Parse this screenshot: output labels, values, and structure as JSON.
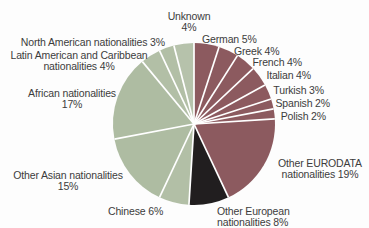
{
  "figure": {
    "background_color": "#fdfdfd",
    "text_color": "#3c3c3c"
  },
  "chart_data": {
    "type": "pie",
    "title": "",
    "start_angle_deg": 0,
    "clockwise": true,
    "legend": "none",
    "center": {
      "x": 194,
      "y": 124
    },
    "radius": 81,
    "separator_color": "#ffffff",
    "separator_width": 1.7,
    "colors": {
      "eurodata_red": "#8c5a5f",
      "european_black": "#211e1f",
      "world_green": "#b2bfa6"
    },
    "slices": [
      {
        "label": "German",
        "value": 5,
        "color": "#8c5a5f"
      },
      {
        "label": "Greek",
        "value": 4,
        "color": "#8c5a5f"
      },
      {
        "label": "French",
        "value": 4,
        "color": "#8c5a5f"
      },
      {
        "label": "Italian",
        "value": 4,
        "color": "#8c5a5f"
      },
      {
        "label": "Turkish",
        "value": 3,
        "color": "#8c5a5f"
      },
      {
        "label": "Spanish",
        "value": 2,
        "color": "#8c5a5f"
      },
      {
        "label": "Polish",
        "value": 2,
        "color": "#8c5a5f"
      },
      {
        "label": "Other EURODATA nationalities",
        "value": 19,
        "color": "#8c5a5f"
      },
      {
        "label": "Other European nationalities",
        "value": 8,
        "color": "#211e1f"
      },
      {
        "label": "Chinese",
        "value": 6,
        "color": "#b2bfa6"
      },
      {
        "label": "Other Asian nationalities",
        "value": 15,
        "color": "#aebca2"
      },
      {
        "label": "African nationalities",
        "value": 17,
        "color": "#aebca2"
      },
      {
        "label": "Latin American and Caribbean nationalities",
        "value": 4,
        "color": "#b2bfa6"
      },
      {
        "label": "North American nationalities",
        "value": 3,
        "color": "#b2bfa6"
      },
      {
        "label": "Unknown",
        "value": 4,
        "color": "#b6c2ab"
      }
    ],
    "labels": [
      {
        "name": "unknown",
        "lines": [
          "Unknown",
          "4%"
        ],
        "x": 189,
        "y": 11,
        "align": "center"
      },
      {
        "name": "german",
        "lines": [
          "German 5%"
        ],
        "x": 202,
        "y": 34,
        "align": "left"
      },
      {
        "name": "greek",
        "lines": [
          "Greek 4%"
        ],
        "x": 234,
        "y": 46,
        "align": "left"
      },
      {
        "name": "french",
        "lines": [
          "French 4%"
        ],
        "x": 302,
        "y": 57,
        "align": "right"
      },
      {
        "name": "italian",
        "lines": [
          "Italian 4%"
        ],
        "x": 311,
        "y": 70,
        "align": "right"
      },
      {
        "name": "turkish",
        "lines": [
          "Turkish 3%"
        ],
        "x": 324,
        "y": 85,
        "align": "right"
      },
      {
        "name": "spanish",
        "lines": [
          "Spanish 2%"
        ],
        "x": 330,
        "y": 98,
        "align": "right"
      },
      {
        "name": "polish",
        "lines": [
          "Polish 2%"
        ],
        "x": 326,
        "y": 111,
        "align": "right"
      },
      {
        "name": "other-eurodata",
        "lines": [
          "Other EURODATA",
          "nationalities 19%"
        ],
        "x": 320,
        "y": 158,
        "align": "center"
      },
      {
        "name": "other-european",
        "lines": [
          "Other European",
          "nationalities 8%"
        ],
        "x": 217,
        "y": 206,
        "align": "left"
      },
      {
        "name": "chinese",
        "lines": [
          "Chinese 6%"
        ],
        "x": 108,
        "y": 206,
        "align": "left"
      },
      {
        "name": "other-asian",
        "lines": [
          "Other Asian nationalities",
          "15%"
        ],
        "x": 68,
        "y": 170,
        "align": "center"
      },
      {
        "name": "african",
        "lines": [
          "African nationalities",
          "17%"
        ],
        "x": 72,
        "y": 88,
        "align": "center"
      },
      {
        "name": "latin-american",
        "lines": [
          "Latin American and Caribbean",
          "nationalities 4%"
        ],
        "x": 79,
        "y": 50,
        "align": "center"
      },
      {
        "name": "north-american",
        "lines": [
          "North American nationalities 3%"
        ],
        "x": 165,
        "y": 37,
        "align": "right"
      }
    ]
  }
}
